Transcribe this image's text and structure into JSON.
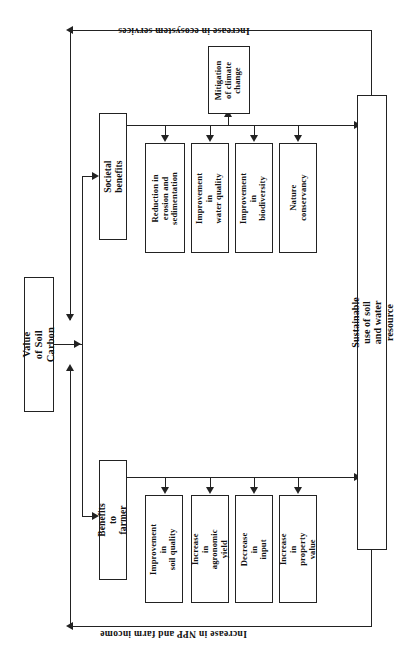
{
  "diagram": {
    "title_top": "Increase in  ecosystem  services",
    "title_bottom": "Increase in NPP and  farm income",
    "root": {
      "label": "Value of Soil Carbon"
    },
    "outcome": {
      "label": "Sustainable use of soil and water resource"
    },
    "branches": [
      {
        "id": "societal",
        "label": "Societal benefits",
        "leaves": [
          {
            "id": "erosion",
            "label": "Reduction in\nerosion and\nsedimentation"
          },
          {
            "id": "water",
            "label": "Improvement in\nwater quality"
          },
          {
            "id": "biodiv",
            "label": "Improvement in\nbiodiversity"
          },
          {
            "id": "nature",
            "label": "Nature\nconservancy"
          }
        ]
      },
      {
        "id": "farmer",
        "label": "Benefits to farmer",
        "leaves": [
          {
            "id": "soilq",
            "label": "Improvement in\nsoil quality"
          },
          {
            "id": "agro",
            "label": "Increase in\nagronomic\nyield"
          },
          {
            "id": "input",
            "label": "Decrease in\ninput"
          },
          {
            "id": "prop",
            "label": "Increase in\nproperty value"
          }
        ]
      }
    ],
    "special": {
      "id": "mitigation",
      "label": "Mitigation\nof climate\nchange"
    },
    "colors": {
      "line": "#222222",
      "box_fill": "#ffffff",
      "text": "#111111"
    }
  }
}
